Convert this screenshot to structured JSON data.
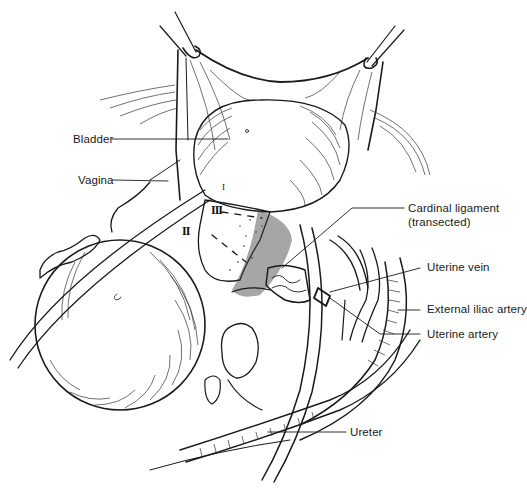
{
  "figure": {
    "type": "surgical anatomical line illustration",
    "background": "#ffffff",
    "ink_color": "#1a1a1a"
  },
  "labels": {
    "bladder": "Bladder",
    "vagina": "Vagina",
    "cardinal_ligament_line1": "Cardinal ligament",
    "cardinal_ligament_line2": "(transected)",
    "uterine_vein": "Uterine vein",
    "external_iliac_artery": "External iliac artery",
    "uterine_artery": "Uterine artery",
    "ureter": "Ureter"
  },
  "numerals": {
    "n3": "III",
    "n2": "II",
    "n1": "I"
  }
}
